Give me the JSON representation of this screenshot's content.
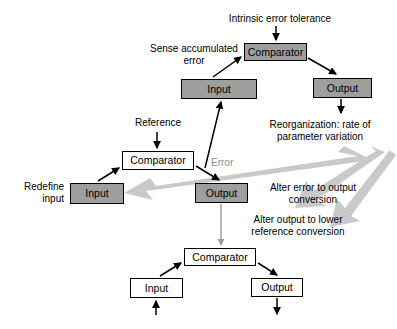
{
  "diagram": {
    "title_label": "Intrinsic error tolerance",
    "boxes": [
      {
        "name": "comparator-top",
        "label": "Comparator",
        "style": "shaded",
        "x": 244,
        "y": 43,
        "w": 63,
        "h": 18
      },
      {
        "name": "input-top",
        "label": "Input",
        "style": "shaded",
        "x": 181,
        "y": 79,
        "w": 76,
        "h": 20
      },
      {
        "name": "output-top",
        "label": "Output",
        "style": "shaded",
        "x": 313,
        "y": 78,
        "w": 59,
        "h": 20
      },
      {
        "name": "comparator-middle",
        "label": "Comparator",
        "style": "plain",
        "x": 122,
        "y": 151,
        "w": 72,
        "h": 19
      },
      {
        "name": "input-middle",
        "label": "Input",
        "style": "shaded",
        "x": 70,
        "y": 183,
        "w": 54,
        "h": 21
      },
      {
        "name": "output-middle",
        "label": "Output",
        "style": "shaded",
        "x": 195,
        "y": 183,
        "w": 53,
        "h": 20
      },
      {
        "name": "comparator-bottom",
        "label": "Comparator",
        "style": "plain",
        "x": 184,
        "y": 248,
        "w": 72,
        "h": 18
      },
      {
        "name": "input-bottom",
        "label": "Input",
        "style": "plain",
        "x": 130,
        "y": 278,
        "w": 53,
        "h": 20
      },
      {
        "name": "output-bottom",
        "label": "Output",
        "style": "plain",
        "x": 251,
        "y": 278,
        "w": 52,
        "h": 19
      }
    ],
    "labels": [
      {
        "name": "label-intrinsic-error-tolerance",
        "text": "Intrinsic error tolerance",
        "align": "c",
        "gray": false,
        "x": 222,
        "y": 13,
        "w": 116
      },
      {
        "name": "label-sense-accumulated-error",
        "text": "Sense accumulated\nerror",
        "align": "c",
        "gray": false,
        "x": 140,
        "y": 43,
        "w": 108
      },
      {
        "name": "label-reorganization-rate",
        "text": "Reorganization: rate of\nparameter variation",
        "align": "c",
        "gray": false,
        "x": 256,
        "y": 119,
        "w": 128
      },
      {
        "name": "label-reference",
        "text": "Reference",
        "align": "c",
        "gray": false,
        "x": 123,
        "y": 117,
        "w": 70
      },
      {
        "name": "label-error",
        "text": "Error",
        "align": "l",
        "gray": true,
        "x": 211,
        "y": 157,
        "w": 40
      },
      {
        "name": "label-redefine-input",
        "text": "Redefine\ninput",
        "align": "r",
        "gray": false,
        "x": 8,
        "y": 181,
        "w": 56
      },
      {
        "name": "label-alter-error-to-output",
        "text": "Alter error to output\nconversion",
        "align": "c",
        "gray": false,
        "x": 250,
        "y": 182,
        "w": 126
      },
      {
        "name": "label-alter-output-to-reference",
        "text": "Alter output to lower\nreference conversion",
        "align": "c",
        "gray": false,
        "x": 228,
        "y": 214,
        "w": 140
      }
    ]
  },
  "colors": {
    "shaded_box_fill": "#9e9e9e",
    "plain_box_fill": "#ffffff",
    "stroke": "#000000",
    "gray_arrow": "#c9c9c9",
    "light_connector": "#9a9a9a"
  }
}
